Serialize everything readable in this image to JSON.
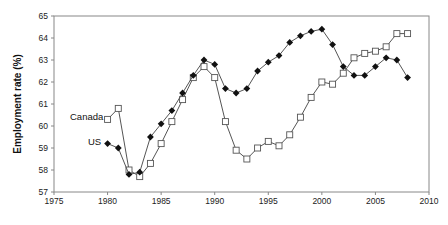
{
  "chart_data": {
    "type": "line",
    "title": "",
    "xlabel": "",
    "ylabel": "Employment rate (%)",
    "xlim": [
      1975,
      2010
    ],
    "ylim": [
      57,
      65
    ],
    "x_ticks": [
      1975,
      1980,
      1985,
      1990,
      1995,
      2000,
      2005,
      2010
    ],
    "y_ticks": [
      57,
      58,
      59,
      60,
      61,
      62,
      63,
      64,
      65
    ],
    "grid": false,
    "legend": "inline labels near start of each series",
    "x": [
      1980,
      1981,
      1982,
      1983,
      1984,
      1985,
      1986,
      1987,
      1988,
      1989,
      1990,
      1991,
      1992,
      1993,
      1994,
      1995,
      1996,
      1997,
      1998,
      1999,
      2000,
      2001,
      2002,
      2003,
      2004,
      2005,
      2006,
      2007,
      2008
    ],
    "series": [
      {
        "name": "Canada",
        "marker": "open-square",
        "values": [
          60.3,
          60.8,
          58.0,
          57.7,
          58.3,
          59.2,
          60.2,
          61.2,
          62.2,
          62.7,
          62.2,
          60.2,
          58.9,
          58.5,
          59.0,
          59.3,
          59.1,
          59.6,
          60.4,
          61.3,
          62.0,
          61.9,
          62.4,
          63.1,
          63.3,
          63.4,
          63.6,
          64.2,
          64.2
        ]
      },
      {
        "name": "US",
        "marker": "filled-diamond",
        "values": [
          59.2,
          59.0,
          57.8,
          57.9,
          59.5,
          60.1,
          60.7,
          61.5,
          62.3,
          63.0,
          62.8,
          61.7,
          61.5,
          61.7,
          62.5,
          62.9,
          63.2,
          63.8,
          64.1,
          64.3,
          64.4,
          63.7,
          62.7,
          62.3,
          62.3,
          62.7,
          63.1,
          63.0,
          62.2
        ]
      }
    ]
  },
  "labels": {
    "ylabel": "Employment rate (%)",
    "canada": "Canada",
    "us": "US"
  },
  "colors": {
    "line": "#555555",
    "axis": "#888888",
    "marker_fill_us": "#111111",
    "marker_fill_canada": "#ffffff"
  }
}
